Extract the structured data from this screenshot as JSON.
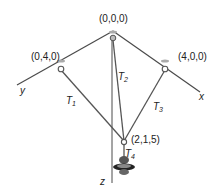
{
  "diagram": {
    "points": {
      "origin": "(0,0,0)",
      "y_anchor": "(0,4,0)",
      "x_anchor": "(4,0,0)",
      "junction": "(2,1,5)"
    },
    "axes": {
      "x": "x",
      "y": "y",
      "z": "z"
    },
    "tensions": {
      "t1": {
        "main": "T",
        "sub": "1"
      },
      "t2": {
        "main": "T",
        "sub": "2"
      },
      "t3": {
        "main": "T",
        "sub": "3"
      },
      "t4": {
        "main": "T",
        "sub": "4"
      }
    },
    "colors": {
      "line": "#4a4a4a",
      "text": "#222222",
      "weight": "#333333"
    }
  }
}
